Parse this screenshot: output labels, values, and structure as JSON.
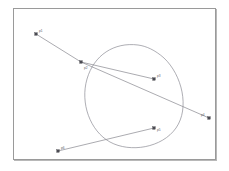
{
  "figure": {
    "title": "",
    "background_color": "#ffffff",
    "frame_color": "#9a9a9a",
    "curve_color": "#8b8b93",
    "polyline_color": "#86868e",
    "marker_color": "#4a4a52",
    "label_color": "#5a5a62"
  },
  "chart_data": {
    "type": "line",
    "title": "",
    "xlabel": "",
    "ylabel": "",
    "grid": false,
    "legend": "none",
    "xlim": [
      0,
      203
    ],
    "ylim": [
      0,
      152
    ],
    "series": [
      {
        "name": "closed-loop-curve",
        "kind": "closed-spline",
        "closed": true,
        "path": "M 124 36 C 100 33, 80 46, 73 70 C 66 94, 76 122, 96 133 C 116 144, 148 139, 162 119 C 176 99, 168 66, 150 49 C 141 41, 132 37, 124 36 Z"
      },
      {
        "name": "control-polyline",
        "kind": "polyline",
        "closed": false,
        "points": [
          [
            22,
            25
          ],
          [
            67,
            53
          ],
          [
            195,
            109
          ]
        ]
      },
      {
        "name": "upper-chord",
        "kind": "polyline",
        "closed": false,
        "points": [
          [
            67,
            53
          ],
          [
            140,
            70
          ]
        ]
      },
      {
        "name": "lower-chord",
        "kind": "polyline",
        "closed": false,
        "points": [
          [
            44,
            142
          ],
          [
            140,
            119
          ]
        ]
      }
    ],
    "vertices": [
      {
        "id": "v1",
        "label": "p1",
        "x": 22,
        "y": 25,
        "label_dx": 3,
        "label_dy": -2
      },
      {
        "id": "v2",
        "label": "p2",
        "x": 67,
        "y": 53,
        "label_dx": 3,
        "label_dy": 7
      },
      {
        "id": "v3",
        "label": "p3",
        "x": 140,
        "y": 70,
        "label_dx": 3,
        "label_dy": -2
      },
      {
        "id": "v4",
        "label": "p4",
        "x": 195,
        "y": 109,
        "label_dx": -8,
        "label_dy": -2
      },
      {
        "id": "v5",
        "label": "p5",
        "x": 140,
        "y": 119,
        "label_dx": 3,
        "label_dy": 3
      },
      {
        "id": "v6",
        "label": "p6",
        "x": 44,
        "y": 142,
        "label_dx": 3,
        "label_dy": -2
      }
    ]
  }
}
